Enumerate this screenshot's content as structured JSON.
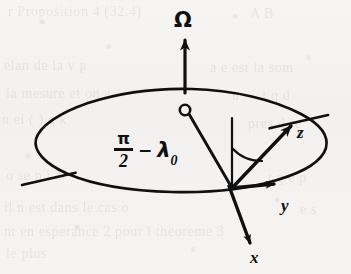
{
  "figure": {
    "kind": "physics-vector-diagram",
    "ink_color": "#101010",
    "paper_color": "#f4f3f1",
    "labels": {
      "omega": "Ω",
      "z": "z",
      "y": "y",
      "x": "x",
      "colatitude": {
        "numerator": "π",
        "denominator": "2",
        "operator": "−",
        "symbol": "λ",
        "subscript": "0",
        "plain": "π/2 − λ₀"
      }
    },
    "elements": [
      {
        "name": "rotation-axis-arrow",
        "label": "Ω"
      },
      {
        "name": "earth-ellipse",
        "label": ""
      },
      {
        "name": "equatorial-chord-line",
        "label": ""
      },
      {
        "name": "center-marker",
        "label": ""
      },
      {
        "name": "radius-line",
        "label": ""
      },
      {
        "name": "local-vertical-reference-line",
        "label": ""
      },
      {
        "name": "colatitude-angle-arc",
        "label": "π/2 − λ₀"
      },
      {
        "name": "z-axis-arrow",
        "label": "z"
      },
      {
        "name": "y-axis-arrow",
        "label": "y"
      },
      {
        "name": "x-axis-arrow",
        "label": "x"
      }
    ]
  },
  "showthrough": {
    "lines": [
      {
        "text": "r Proposition  4 (32.4)",
        "x": 8,
        "y": 4
      },
      {
        "text": "A  B",
        "x": 250,
        "y": 6
      },
      {
        "text": "elan  de  la  v  p",
        "x": 4,
        "y": 58
      },
      {
        "text": "a  e  est  la  som",
        "x": 210,
        "y": 60
      },
      {
        "text": "la  mesure  et  on  a",
        "x": 6,
        "y": 86
      },
      {
        "text": "u  —  t  q  d",
        "x": 232,
        "y": 88
      },
      {
        "text": "n  ei  ( ) q  k",
        "x": 2,
        "y": 112
      },
      {
        "text": "pres  d  re",
        "x": 248,
        "y": 116
      },
      {
        "text": "o  se  p  l  N",
        "x": 6,
        "y": 168
      },
      {
        "text": "t  q  e  p",
        "x": 268,
        "y": 170
      },
      {
        "text": "il  n  est  dans  le  cas  o",
        "x": 4,
        "y": 200
      },
      {
        "text": "e  s",
        "x": 300,
        "y": 202
      },
      {
        "text": "nt  en  esperance  2  pour  l  theoreme  3",
        "x": 4,
        "y": 224
      },
      {
        "text": "le  plus",
        "x": 6,
        "y": 246
      }
    ]
  }
}
